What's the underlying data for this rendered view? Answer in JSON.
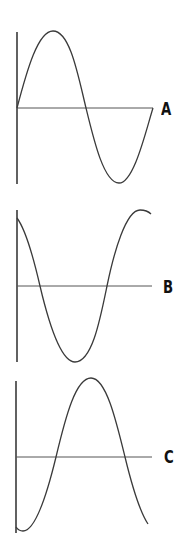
{
  "panels": [
    {
      "label": "A",
      "waveform": "sine",
      "phase": "starts at zero, rising"
    },
    {
      "label": "B",
      "waveform": "cosine",
      "phase": "starts at maximum, falling"
    },
    {
      "label": "C",
      "waveform": "negative cosine",
      "phase": "starts at minimum, rising"
    }
  ],
  "colors": {
    "line": "#3a3a3a",
    "baseline": "#555555",
    "label": "#111111",
    "background": "#ffffff"
  }
}
